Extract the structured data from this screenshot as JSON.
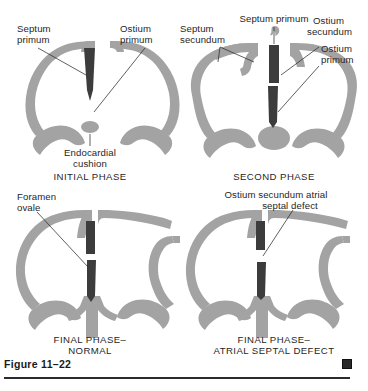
{
  "figure": {
    "number": "Figure 11–22",
    "end_marker": "end-of-figure-square"
  },
  "panels": [
    {
      "id": "initial-phase",
      "caption": "INITIAL PHASE",
      "labels": {
        "septum_primum_l1": "Septum",
        "septum_primum_l2": "primum",
        "ostium_primum_l1": "Ostium",
        "ostium_primum_l2": "primum",
        "endocardial_cushion_l1": "Endocardial",
        "endocardial_cushion_l2": "cushion"
      }
    },
    {
      "id": "second-phase",
      "caption": "SECOND PHASE",
      "labels": {
        "septum_primum": "Septum primum",
        "septum_secundum_l1": "Septum",
        "septum_secundum_l2": "secundum",
        "ostium_secundum_l1": "Ostium",
        "ostium_secundum_l2": "secundum",
        "ostium_primum_l1": "Ostium",
        "ostium_primum_l2": "primum"
      }
    },
    {
      "id": "final-phase-normal",
      "caption_l1": "FINAL PHASE–",
      "caption_l2": "NORMAL",
      "labels": {
        "foramen_ovale_l1": "Foramen",
        "foramen_ovale_l2": "ovale"
      }
    },
    {
      "id": "final-phase-atrial-septal-defect",
      "caption_l1": "FINAL PHASE–",
      "caption_l2": "ATRIAL SEPTAL DEFECT",
      "labels": {
        "defect_l1": "Ostium secundum atrial",
        "defect_l2": "septal defect"
      }
    }
  ],
  "colors": {
    "wall_gray": "#a3a3a3",
    "septum_dark": "#3c3c3c",
    "text": "#262626",
    "rule": "#2b2b2b",
    "background": "#ffffff"
  }
}
